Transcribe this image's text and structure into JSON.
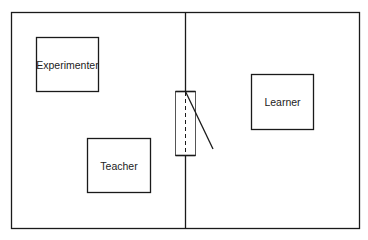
{
  "diagram": {
    "type": "floor-plan",
    "stroke_color": "#1a1a1a",
    "background": "#ffffff",
    "rooms": [
      {
        "name": "left-room"
      },
      {
        "name": "right-room"
      }
    ],
    "boxes": {
      "experimenter": {
        "label": "Experimenter"
      },
      "teacher": {
        "label": "Teacher"
      },
      "learner": {
        "label": "Learner"
      }
    },
    "door": {
      "style": "open-door-with-dashed-line"
    }
  }
}
